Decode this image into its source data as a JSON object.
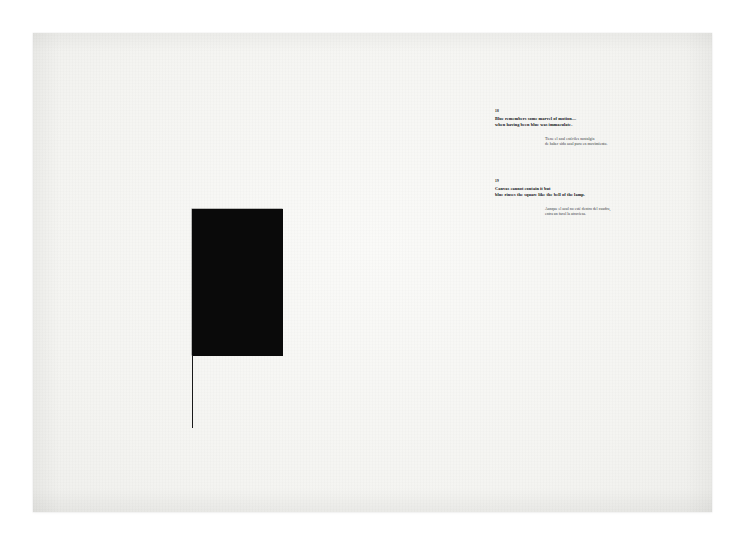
{
  "artwork": {
    "medium_note": "black rectangle with descending hairline",
    "ink_color": "#0a0a0a",
    "paper_color": "#f6f6f4",
    "rectangle": {
      "x": 159,
      "y": 176,
      "width": 91,
      "height": 147
    },
    "drop_line": {
      "x": 159,
      "y": 322,
      "height": 73
    }
  },
  "poem": {
    "stanzas": [
      {
        "number": "18",
        "english": [
          "Blue remembers some marvel of motion—",
          "when having been blue was immaculate."
        ],
        "spanish": [
          "Tiene el azul estériles nostalgia",
          "de haber sido azul puro en movimiento."
        ]
      },
      {
        "number": "19",
        "english": [
          "Canvas cannot contain it but",
          "blue rinses the square like the bell of the lamp."
        ],
        "spanish": [
          "Aunque el azul no esté dentro del cuadro,",
          "entra un farol la atraviesa."
        ]
      }
    ]
  },
  "marks": {
    "lower_left": "",
    "lower_right": ""
  }
}
